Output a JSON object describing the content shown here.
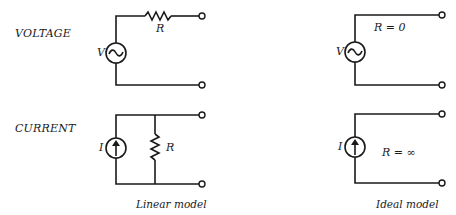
{
  "diagram": {
    "row_labels": {
      "voltage": "VOLTAGE",
      "current": "CURRENT"
    },
    "linear_model": {
      "caption": "Linear model",
      "voltage_source": {
        "symbol": "V",
        "icon": "ac-voltage-source-icon"
      },
      "voltage_resistor": {
        "symbol": "R",
        "placement": "series"
      },
      "current_source": {
        "symbol": "I",
        "icon": "current-source-arrow-up-icon"
      },
      "current_resistor": {
        "symbol": "R",
        "placement": "parallel"
      }
    },
    "ideal_model": {
      "caption": "Ideal model",
      "voltage_source": {
        "symbol": "V",
        "icon": "ac-voltage-source-icon"
      },
      "voltage_resistance": "R = 0",
      "current_source": {
        "symbol": "I",
        "icon": "current-source-arrow-up-icon"
      },
      "current_resistance": "R = ∞"
    },
    "colors": {
      "line": "#1a1a1a",
      "background": "#ffffff"
    }
  }
}
